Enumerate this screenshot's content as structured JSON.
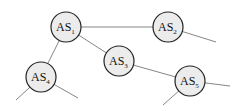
{
  "diagram": {
    "title": "",
    "nodes": [
      {
        "id": "AS1",
        "label": "AS",
        "sub": "1",
        "x": 66,
        "y": 27
      },
      {
        "id": "AS2",
        "label": "AS",
        "sub": "2",
        "x": 168,
        "y": 27
      },
      {
        "id": "AS3",
        "label": "AS",
        "sub": "3",
        "x": 119,
        "y": 61
      },
      {
        "id": "AS4",
        "label": "AS",
        "sub": "4",
        "x": 41,
        "y": 77
      },
      {
        "id": "AS5",
        "label": "AS",
        "sub": "5",
        "x": 190,
        "y": 81
      }
    ],
    "edges": [
      {
        "from": "AS1",
        "to": "AS2"
      },
      {
        "from": "AS1",
        "to": "AS3"
      },
      {
        "from": "AS1",
        "to": "AS4"
      },
      {
        "from": "AS3",
        "to": "AS5"
      }
    ],
    "dangling_edges": [
      {
        "from": "AS2",
        "to": [
          216,
          42
        ]
      },
      {
        "from": "AS4",
        "to": [
          16,
          100
        ]
      },
      {
        "from": "AS4",
        "to": [
          78,
          98
        ]
      },
      {
        "from": "AS5",
        "to": [
          230,
          86
        ]
      },
      {
        "from": "AS5",
        "to": [
          163,
          105
        ]
      }
    ]
  }
}
